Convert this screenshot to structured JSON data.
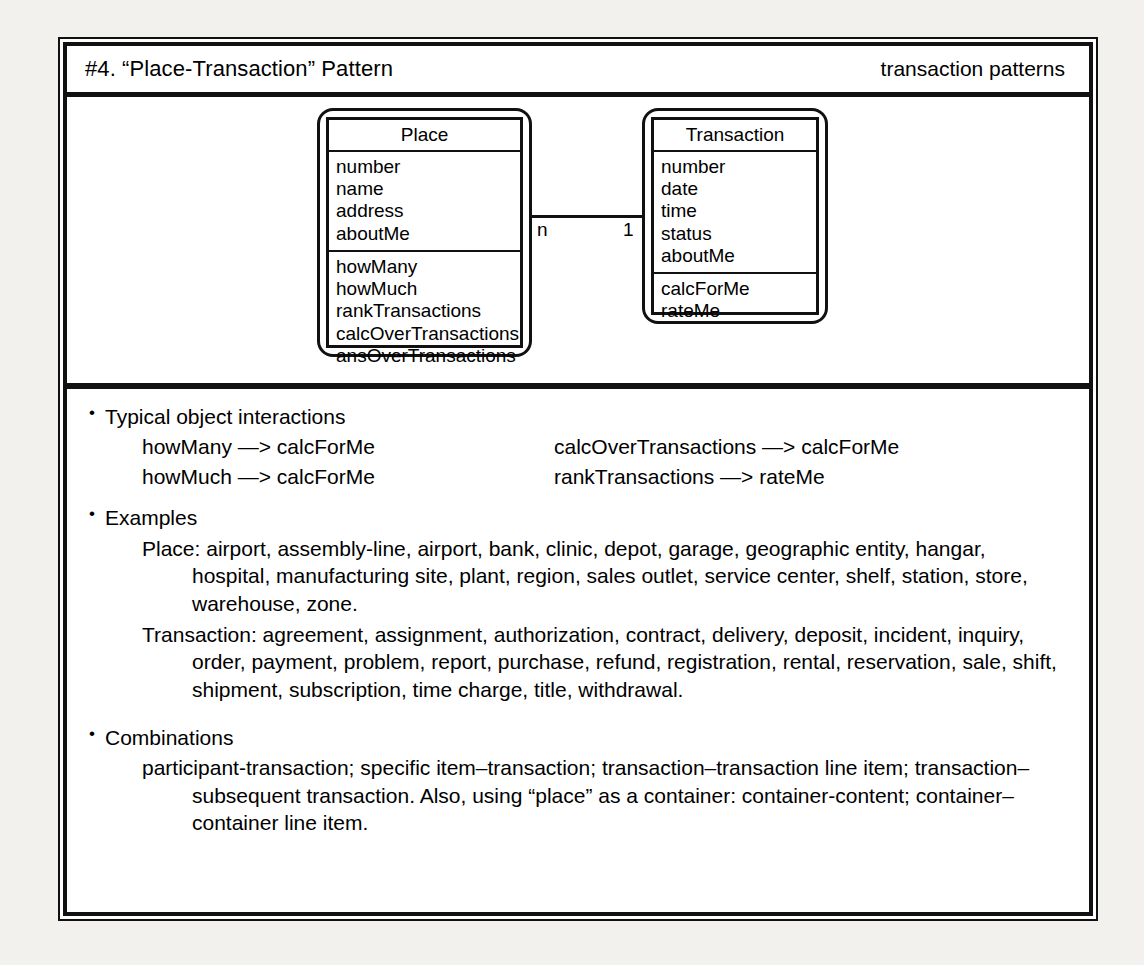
{
  "header": {
    "title": "#4. “Place-Transaction” Pattern",
    "category": "transaction patterns"
  },
  "diagram": {
    "classes": [
      {
        "name": "Place",
        "attributes": [
          "number",
          "name",
          "address",
          "aboutMe"
        ],
        "operations": [
          "howMany",
          "howMuch",
          "rankTransactions",
          "calcOverTransactions",
          "ansOverTransactions"
        ]
      },
      {
        "name": "Transaction",
        "attributes": [
          "number",
          "date",
          "time",
          "status",
          "aboutMe"
        ],
        "operations": [
          "calcForMe",
          "rateMe"
        ]
      }
    ],
    "association": {
      "source_multiplicity": "n",
      "target_multiplicity": "1"
    }
  },
  "sections": {
    "interactions": {
      "heading": "Typical object interactions",
      "left": [
        "howMany —> calcForMe",
        "howMuch —> calcForMe"
      ],
      "right": [
        "calcOverTransactions —> calcForMe",
        "rankTransactions —> rateMe"
      ]
    },
    "examples": {
      "heading": "Examples",
      "entries": [
        {
          "label": "Place:",
          "text": "Place: airport, assembly-line, airport, bank, clinic, depot, garage, geographic entity, hangar, hospital, manufacturing site, plant, region, sales outlet, service center, shelf, station, store, warehouse, zone."
        },
        {
          "label": "Transaction:",
          "text": "Transaction: agreement, assignment, authorization, contract, delivery, deposit, incident, inquiry, order, payment, problem, report, purchase, refund, registration, rental, reservation, sale, shift, shipment, subscription, time charge, title, withdrawal."
        }
      ]
    },
    "combinations": {
      "heading": "Combinations",
      "text": "participant-transaction; specific item–transaction; transaction–transaction line item; transaction–subsequent transaction. Also, using “place” as a container: container-content; container–container line item."
    }
  }
}
